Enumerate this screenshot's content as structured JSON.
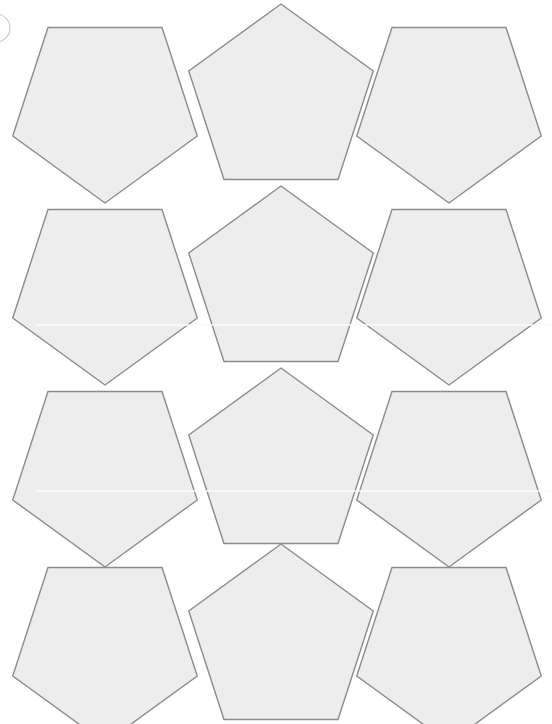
{
  "canvas": {
    "width": 552,
    "height": 724,
    "background_color": "#ffffff",
    "title": "Pentagon Tiling Sheet"
  },
  "style": {
    "shape_fill": "#ededed",
    "shape_stroke": "#8c8c8c",
    "shape_stroke_width": 1.4,
    "arc_stroke": "#c9c9c9",
    "scanline_color": "#fbfbfb"
  },
  "grid": {
    "rows": 4,
    "columns": 3,
    "shape_count": 12,
    "row_pitch": 182,
    "column_centers": [
      105,
      280,
      449
    ],
    "row_top_offsets": [
      5,
      187,
      369,
      545
    ],
    "circumradius": 97,
    "orientation_by_column": [
      "point-down",
      "point-up",
      "point-down"
    ]
  },
  "shapes": [
    {
      "id": "pentagon-r1c1",
      "row": 1,
      "column": 1,
      "cx": 105,
      "cy": 106,
      "r": 97,
      "orientation": "point-down"
    },
    {
      "id": "pentagon-r1c2",
      "row": 1,
      "column": 2,
      "cx": 281,
      "cy": 101,
      "r": 97,
      "orientation": "point-up"
    },
    {
      "id": "pentagon-r1c3",
      "row": 1,
      "column": 3,
      "cx": 449,
      "cy": 106,
      "r": 97,
      "orientation": "point-down"
    },
    {
      "id": "pentagon-r2c1",
      "row": 2,
      "column": 1,
      "cx": 105,
      "cy": 288,
      "r": 97,
      "orientation": "point-down"
    },
    {
      "id": "pentagon-r2c2",
      "row": 2,
      "column": 2,
      "cx": 281,
      "cy": 283,
      "r": 97,
      "orientation": "point-up"
    },
    {
      "id": "pentagon-r2c3",
      "row": 2,
      "column": 3,
      "cx": 449,
      "cy": 288,
      "r": 97,
      "orientation": "point-down"
    },
    {
      "id": "pentagon-r3c1",
      "row": 3,
      "column": 1,
      "cx": 105,
      "cy": 470,
      "r": 97,
      "orientation": "point-down"
    },
    {
      "id": "pentagon-r3c2",
      "row": 3,
      "column": 2,
      "cx": 281,
      "cy": 465,
      "r": 97,
      "orientation": "point-up"
    },
    {
      "id": "pentagon-r3c3",
      "row": 3,
      "column": 3,
      "cx": 449,
      "cy": 470,
      "r": 97,
      "orientation": "point-down"
    },
    {
      "id": "pentagon-r4c1",
      "row": 4,
      "column": 1,
      "cx": 105,
      "cy": 646,
      "r": 97,
      "orientation": "point-down"
    },
    {
      "id": "pentagon-r4c2",
      "row": 4,
      "column": 2,
      "cx": 281,
      "cy": 641,
      "r": 97,
      "orientation": "point-up"
    },
    {
      "id": "pentagon-r4c3",
      "row": 4,
      "column": 3,
      "cx": 449,
      "cy": 646,
      "r": 97,
      "orientation": "point-down"
    }
  ],
  "decorations": {
    "corner_arc": {
      "id": "corner-arc",
      "cx": -4,
      "cy": 28,
      "r": 14,
      "description": "partially cropped circle outline at left edge"
    },
    "scanlines": [
      {
        "y": 325,
        "x1": 36,
        "x2": 552
      },
      {
        "y": 491,
        "x1": 36,
        "x2": 552
      }
    ]
  }
}
